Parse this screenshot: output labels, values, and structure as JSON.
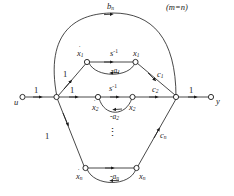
{
  "figure": {
    "type": "signal-flow-graph",
    "title_note": "(m=n)",
    "top_branch_label": "b",
    "top_branch_sub": "n",
    "input_node": "u",
    "output_node": "y",
    "input_gain": "1",
    "output_gain": "1",
    "summing_to_row_gain": "1",
    "integrator": "s",
    "integrator_sup": "-1",
    "ellipsis": "⋮",
    "colors": {
      "stroke": "#1a1a1a",
      "text": "#1a1a1a",
      "background": "#ffffff"
    }
  },
  "rows": [
    {
      "id": "row-1",
      "state_dot_label": "x",
      "state_dot_sub": "1",
      "state_label": "x",
      "state_sub": "1",
      "forward_gain": "s",
      "forward_gain_sup": "-1",
      "feedback_gain": "-a",
      "feedback_gain_sub": "1",
      "input_gain": "1",
      "output_gain": "c",
      "output_gain_sub": "1"
    },
    {
      "id": "row-2",
      "state_dot_label": "x",
      "state_dot_sub": "2",
      "state_label": "x",
      "state_sub": "2",
      "forward_gain": "s",
      "forward_gain_sup": "-1",
      "feedback_gain": "-a",
      "feedback_gain_sub": "2",
      "input_gain": "1",
      "output_gain": "c",
      "output_gain_sub": "2"
    },
    {
      "id": "row-n",
      "state_dot_label": "x",
      "state_dot_sub": "n",
      "state_label": "x",
      "state_sub": "n",
      "forward_gain": "s",
      "forward_gain_sup": "-1",
      "feedback_gain": "-a",
      "feedback_gain_sub": "n",
      "input_gain": "1",
      "output_gain": "c",
      "output_gain_sub": "n"
    }
  ]
}
